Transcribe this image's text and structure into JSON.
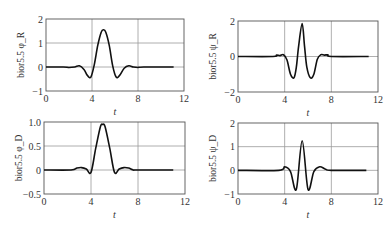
{
  "chart_data": [
    {
      "type": "line",
      "panel": "top-left",
      "title": "",
      "xlabel": "t",
      "ylabel": "bior5.5 φ_R",
      "xlim": [
        0,
        12
      ],
      "ylim": [
        -1,
        2
      ],
      "xticks": [
        0,
        4,
        8,
        12
      ],
      "yticks": [
        -1,
        0,
        1,
        2
      ],
      "grid": true,
      "frame": {
        "left": 46,
        "top": 19,
        "right": 184,
        "bottom": 91
      },
      "x": [
        0,
        1.5,
        2.0,
        2.5,
        2.9,
        3.3,
        3.6,
        3.9,
        4.2,
        4.5,
        4.8,
        5.0,
        5.2,
        5.5,
        5.8,
        6.1,
        6.4,
        6.8,
        7.2,
        7.6,
        8.0,
        8.5,
        11.1
      ],
      "values": [
        0,
        0,
        -0.02,
        0.0,
        0.05,
        -0.1,
        -0.35,
        -0.42,
        0.1,
        0.9,
        1.45,
        1.55,
        1.45,
        0.9,
        0.05,
        -0.42,
        -0.35,
        -0.05,
        0.05,
        0.0,
        -0.02,
        0,
        0
      ]
    },
    {
      "type": "line",
      "panel": "top-right",
      "title": "",
      "xlabel": "t",
      "ylabel": "bior5.5 ψ_R",
      "xlim": [
        0,
        12
      ],
      "ylim": [
        -2,
        2
      ],
      "xticks": [
        0,
        4,
        8,
        12
      ],
      "yticks": [
        -2,
        0,
        2
      ],
      "grid": true,
      "frame": {
        "left": 238,
        "top": 21,
        "right": 378,
        "bottom": 92
      },
      "x": [
        0,
        3.0,
        3.3,
        3.6,
        3.9,
        4.2,
        4.5,
        4.8,
        5.0,
        5.2,
        5.5,
        5.7,
        5.9,
        6.2,
        6.5,
        6.8,
        7.1,
        7.4,
        7.7,
        8.0,
        11.2
      ],
      "values": [
        0,
        0,
        0.08,
        0.05,
        0.1,
        -0.2,
        -1.0,
        -1.2,
        -0.6,
        0.6,
        1.85,
        0.6,
        -0.6,
        -1.2,
        -1.0,
        -0.15,
        0.1,
        0.08,
        0.1,
        0,
        0
      ]
    },
    {
      "type": "line",
      "panel": "bottom-left",
      "title": "",
      "xlabel": "t",
      "ylabel": "bior5.5 φ_D",
      "xlim": [
        0,
        12
      ],
      "ylim": [
        -0.5,
        1.0
      ],
      "xticks": [
        0,
        4,
        8,
        12
      ],
      "yticks": [
        -0.5,
        0,
        0.5,
        1.0
      ],
      "ytick_labels": [
        "−0.5",
        "0",
        "0.5",
        "1.0"
      ],
      "grid": true,
      "frame": {
        "left": 44,
        "top": 122,
        "right": 185,
        "bottom": 194
      },
      "x": [
        0,
        2.3,
        2.8,
        3.2,
        3.6,
        4.0,
        4.4,
        4.8,
        5.0,
        5.2,
        5.6,
        6.0,
        6.4,
        6.8,
        7.2,
        7.6,
        8.0,
        11.0
      ],
      "values": [
        0,
        0,
        0.04,
        0.05,
        0.02,
        -0.05,
        0.45,
        0.9,
        0.95,
        0.9,
        0.45,
        -0.05,
        0.02,
        0.05,
        0.04,
        0.0,
        0,
        0
      ]
    },
    {
      "type": "line",
      "panel": "bottom-right",
      "title": "",
      "xlabel": "t",
      "ylabel": "bior5.5 ψ_D",
      "xlim": [
        0,
        12
      ],
      "ylim": [
        -1,
        2
      ],
      "xticks": [
        0,
        4,
        8,
        12
      ],
      "yticks": [
        -1,
        0,
        1,
        2
      ],
      "grid": true,
      "frame": {
        "left": 238,
        "top": 123,
        "right": 378,
        "bottom": 194
      },
      "x": [
        0,
        3.5,
        4.0,
        4.5,
        5.0,
        5.5,
        6.0,
        6.5,
        7.0,
        7.5,
        8.0,
        11.0
      ],
      "values": [
        0,
        0,
        0.15,
        -0.05,
        -0.8,
        1.25,
        -0.8,
        -0.05,
        0.15,
        0.05,
        0,
        0
      ]
    }
  ],
  "panels": [
    {
      "ylabel": "bior5.5 φ_R",
      "xlabel": "t"
    },
    {
      "ylabel": "bior5.5 ψ_R",
      "xlabel": "t"
    },
    {
      "ylabel": "bior5.5 φ_D",
      "xlabel": "t"
    },
    {
      "ylabel": "bior5.5 ψ_D",
      "xlabel": "t"
    }
  ],
  "colors": {
    "line": "#111111",
    "grid": "#9a9a9a",
    "frame": "#555555"
  }
}
